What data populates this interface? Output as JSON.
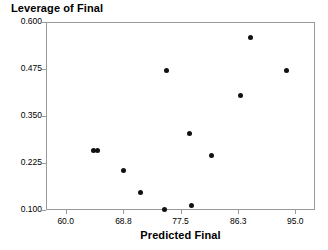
{
  "chart_data": {
    "type": "scatter",
    "title": "Leverage of Final",
    "xlabel": "Predicted Final",
    "ylabel": "",
    "xlim": [
      57.0,
      98.0
    ],
    "ylim": [
      0.1,
      0.6
    ],
    "grid": false,
    "legend": null,
    "xticks": [
      "60.0",
      "68.8",
      "77.5",
      "86.3",
      "95.0"
    ],
    "xtick_values": [
      60.0,
      68.8,
      77.5,
      86.3,
      95.0
    ],
    "yticks": [
      "0.600",
      "0.475",
      "0.350",
      "0.225",
      "0.100"
    ],
    "ytick_values": [
      0.6,
      0.475,
      0.35,
      0.225,
      0.1
    ],
    "marker": "filled-circle",
    "marker_color": "#111111",
    "points": [
      {
        "x": 64.3,
        "y": 0.259
      },
      {
        "x": 64.8,
        "y": 0.258
      },
      {
        "x": 68.8,
        "y": 0.205
      },
      {
        "x": 71.4,
        "y": 0.146
      },
      {
        "x": 75.1,
        "y": 0.102
      },
      {
        "x": 75.4,
        "y": 0.472
      },
      {
        "x": 78.9,
        "y": 0.303
      },
      {
        "x": 79.2,
        "y": 0.112
      },
      {
        "x": 82.3,
        "y": 0.246
      },
      {
        "x": 86.6,
        "y": 0.405
      },
      {
        "x": 88.1,
        "y": 0.56
      },
      {
        "x": 93.6,
        "y": 0.472
      }
    ]
  },
  "axis_colors": {
    "frame": "#9a9a9a",
    "text": "#000000",
    "background": "#ffffff"
  }
}
